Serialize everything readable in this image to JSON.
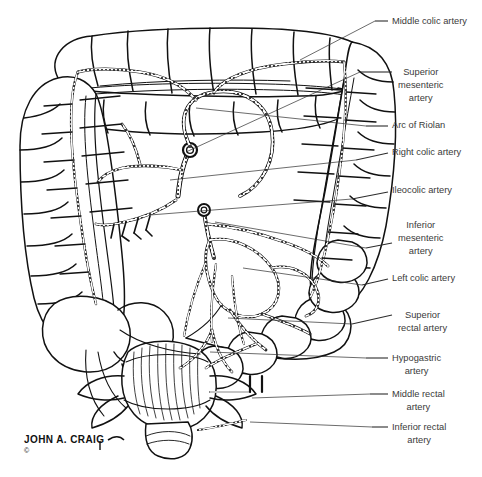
{
  "figure": {
    "credit_signature": "JOHN A. CRAIG",
    "copyright_mark": "©",
    "ink_color": "#111111",
    "label_color": "#3a3a3a",
    "background_color": "#ffffff"
  },
  "labels": [
    {
      "id": "middle-colic-artery",
      "lines": [
        "Middle colic artery"
      ],
      "text_x": 392,
      "text_y": 24,
      "leader": {
        "x1": 375,
        "y1": 21,
        "x2": 388,
        "y2": 21
      },
      "anchor": {
        "x": 300,
        "y": 60
      }
    },
    {
      "id": "superior-mesenteric-artery",
      "lines": [
        "Superior",
        "mesenteric",
        "artery"
      ],
      "text_x": 398,
      "text_y": 75,
      "leader": {
        "x1": 360,
        "y1": 72,
        "x2": 392,
        "y2": 72
      },
      "anchor": {
        "x": 186,
        "y": 152
      }
    },
    {
      "id": "arc-of-riolan",
      "lines": [
        "Arc of Riolan"
      ],
      "text_x": 392,
      "text_y": 128,
      "leader": {
        "x1": 366,
        "y1": 126,
        "x2": 388,
        "y2": 126
      },
      "anchor": {
        "x": 196,
        "y": 108
      }
    },
    {
      "id": "right-colic-artery",
      "lines": [
        "Right colic artery"
      ],
      "text_x": 392,
      "text_y": 155,
      "leader": {
        "x1": 356,
        "y1": 160,
        "x2": 388,
        "y2": 153
      },
      "anchor": {
        "x": 170,
        "y": 180
      }
    },
    {
      "id": "ileocolic-artery",
      "lines": [
        "Ileocolic artery"
      ],
      "text_x": 392,
      "text_y": 193,
      "leader": {
        "x1": 352,
        "y1": 199,
        "x2": 388,
        "y2": 192
      },
      "anchor": {
        "x": 150,
        "y": 215
      }
    },
    {
      "id": "inferior-mesenteric-artery",
      "lines": [
        "Inferior",
        "mesenteric",
        "artery"
      ],
      "text_x": 398,
      "text_y": 228,
      "leader": {
        "x1": 366,
        "y1": 248,
        "x2": 392,
        "y2": 243
      },
      "anchor": {
        "x": 215,
        "y": 222
      }
    },
    {
      "id": "left-colic-artery",
      "lines": [
        "Left colic artery"
      ],
      "text_x": 392,
      "text_y": 281,
      "leader": {
        "x1": 362,
        "y1": 285,
        "x2": 388,
        "y2": 279
      },
      "anchor": {
        "x": 243,
        "y": 268
      }
    },
    {
      "id": "superior-rectal-artery",
      "lines": [
        "Superior",
        "rectal artery"
      ],
      "text_x": 398,
      "text_y": 318,
      "leader": {
        "x1": 352,
        "y1": 324,
        "x2": 392,
        "y2": 315
      },
      "anchor": {
        "x": 228,
        "y": 318
      }
    },
    {
      "id": "hypogastric-artery",
      "lines": [
        "Hypogastric",
        "artery"
      ],
      "text_x": 392,
      "text_y": 361,
      "leader": {
        "x1": 366,
        "y1": 358,
        "x2": 388,
        "y2": 358
      },
      "anchor": {
        "x": 210,
        "y": 352
      }
    },
    {
      "id": "middle-rectal-artery",
      "lines": [
        "Middle rectal",
        "artery"
      ],
      "text_x": 392,
      "text_y": 397,
      "leader": {
        "x1": 370,
        "y1": 394,
        "x2": 388,
        "y2": 394
      },
      "anchor": {
        "x": 252,
        "y": 398
      }
    },
    {
      "id": "inferior-rectal-artery",
      "lines": [
        "Inferior rectal",
        "artery"
      ],
      "text_x": 392,
      "text_y": 430,
      "leader": {
        "x1": 372,
        "y1": 427,
        "x2": 388,
        "y2": 427
      },
      "anchor": {
        "x": 250,
        "y": 422
      }
    }
  ],
  "anatomy_parts": [
    "transverse-colon",
    "ascending-colon",
    "descending-colon",
    "cecum",
    "appendix",
    "sigmoid-colon",
    "rectum",
    "anal-canal",
    "marginal-artery",
    "vasa-recta",
    "mesenteric-arcades"
  ]
}
